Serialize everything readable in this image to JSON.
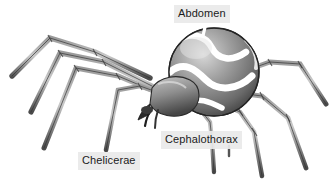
{
  "figure": {
    "background_color": "#ffffff",
    "width": 334,
    "height": 180
  },
  "labels": [
    {
      "id": "abdomen",
      "text": "Abdomen",
      "background_color": "#e9e9e9",
      "text_color": "#1b1b1b"
    },
    {
      "id": "cephalothorax",
      "text": "Cephalothorax",
      "background_color": "#e9e9e9",
      "text_color": "#1b1b1b"
    },
    {
      "id": "chelicerae",
      "text": "Chelicerae",
      "background_color": "#e9e9e9",
      "text_color": "#1b1b1b"
    }
  ],
  "illustration": {
    "style": "grayscale-pen-and-ink",
    "body_colors": {
      "outline": "#2b2b2b",
      "shadow": "#4e4e4e",
      "midtone": "#8a8a8a",
      "highlight": "#f2f2f2",
      "stripe": "#ffffff"
    },
    "parts": {
      "abdomen": "large striped sphere, upper right",
      "cephalothorax": "smaller segmented body, lower center",
      "chelicerae": "dark fangs at front lower left of cephalothorax",
      "legs": "eight long jointed legs radiating left and right"
    },
    "leader_lines": {
      "color": "#ffffff",
      "abdomen": "from label down onto top of abdomen",
      "cephalothorax": "short vertical tick below label plus line up to body",
      "chelicerae": "diagonal line up-right from label to fangs"
    }
  }
}
